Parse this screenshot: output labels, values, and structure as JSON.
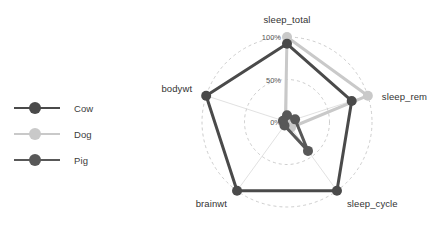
{
  "legend": {
    "position": "left",
    "items": [
      {
        "label": "Cow",
        "color": "#4a4a4a"
      },
      {
        "label": "Dog",
        "color": "#c9c9c9"
      },
      {
        "label": "Pig",
        "color": "#585858"
      }
    ]
  },
  "chart_data": {
    "type": "radar",
    "title": "",
    "subtitle": "",
    "xlabel": "",
    "ylabel": "",
    "grid": true,
    "grid_style": "dashed-circles",
    "legend_position": "left",
    "categories": [
      "sleep_total",
      "sleep_rem",
      "sleep_cycle",
      "brainwt",
      "bodywt"
    ],
    "tick_labels": [
      "0%",
      "50%",
      "100%"
    ],
    "tick_values": [
      0,
      50,
      100
    ],
    "rlim": [
      0,
      100
    ],
    "units": "percent",
    "series": [
      {
        "name": "Cow",
        "color": "#4a4a4a",
        "values": [
          92,
          80,
          100,
          100,
          100
        ]
      },
      {
        "name": "Dog",
        "color": "#c9c9c9",
        "values": [
          100,
          100,
          8,
          3,
          2
        ]
      },
      {
        "name": "Pig",
        "color": "#585858",
        "values": [
          8,
          10,
          42,
          5,
          5
        ]
      }
    ]
  },
  "axes": {
    "labels": {
      "sleep_total": "sleep_total",
      "sleep_rem": "sleep_rem",
      "sleep_cycle": "sleep_cycle",
      "brainwt": "brainwt",
      "bodywt": "bodywt"
    }
  },
  "ticks": {
    "zero": "0%",
    "half": "50%",
    "full": "100%"
  },
  "colors": {
    "background": "#ffffff",
    "grid": "#b8b8b8",
    "spoke": "#d4d4d4",
    "text": "#333333"
  }
}
